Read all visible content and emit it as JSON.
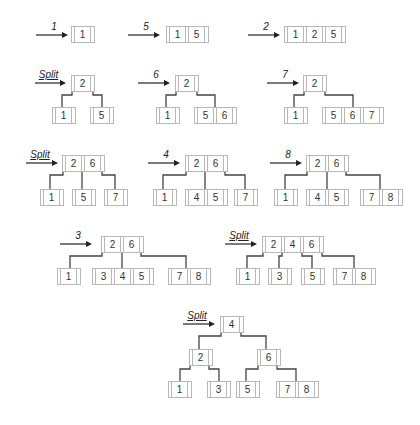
{
  "colors": {
    "edge": "#444444",
    "border": "#b8b8b8",
    "text": "#333333"
  },
  "steps": [
    {
      "label": "1",
      "arrow": [
        36,
        68,
        35
      ],
      "nodes": [
        {
          "keys": [
            "1"
          ],
          "x": 71,
          "y": 26
        }
      ],
      "edges": []
    },
    {
      "label": "5",
      "arrow": [
        128,
        160,
        35
      ],
      "nodes": [
        {
          "keys": [
            "1",
            "5"
          ],
          "x": 166,
          "y": 26
        }
      ],
      "edges": []
    },
    {
      "label": "2",
      "arrow": [
        248,
        280,
        35
      ],
      "nodes": [
        {
          "keys": [
            "1",
            "2",
            "5"
          ],
          "x": 284,
          "y": 26
        }
      ],
      "edges": []
    },
    {
      "label": "Split",
      "arrow": [
        35,
        66,
        83
      ],
      "nodes": [
        {
          "keys": [
            "2"
          ],
          "x": 71,
          "y": 75
        },
        {
          "keys": [
            "1"
          ],
          "x": 52,
          "y": 107
        },
        {
          "keys": [
            "5"
          ],
          "x": 90,
          "y": 107
        }
      ],
      "edges": [
        [
          72,
          89,
          62,
          107
        ],
        [
          93,
          89,
          102,
          107
        ]
      ]
    },
    {
      "label": "6",
      "arrow": [
        138,
        170,
        83
      ],
      "nodes": [
        {
          "keys": [
            "2"
          ],
          "x": 175,
          "y": 75
        },
        {
          "keys": [
            "1"
          ],
          "x": 156,
          "y": 107
        },
        {
          "keys": [
            "5",
            "6"
          ],
          "x": 194,
          "y": 107
        }
      ],
      "edges": [
        [
          176,
          89,
          166,
          107
        ],
        [
          197,
          89,
          215,
          107
        ]
      ]
    },
    {
      "label": "7",
      "arrow": [
        267,
        299,
        83
      ],
      "nodes": [
        {
          "keys": [
            "2"
          ],
          "x": 303,
          "y": 75
        },
        {
          "keys": [
            "1"
          ],
          "x": 284,
          "y": 107
        },
        {
          "keys": [
            "5",
            "6",
            "7"
          ],
          "x": 322,
          "y": 107
        }
      ],
      "edges": [
        [
          304,
          89,
          294,
          107
        ],
        [
          325,
          89,
          353,
          107
        ]
      ]
    },
    {
      "label": "Split",
      "arrow": [
        26,
        58,
        163
      ],
      "nodes": [
        {
          "keys": [
            "2",
            "6"
          ],
          "x": 62,
          "y": 155
        },
        {
          "keys": [
            "1"
          ],
          "x": 40,
          "y": 189
        },
        {
          "keys": [
            "5"
          ],
          "x": 72,
          "y": 189
        },
        {
          "keys": [
            "7"
          ],
          "x": 104,
          "y": 189
        }
      ],
      "edges": [
        [
          63,
          169,
          50,
          189
        ],
        [
          82,
          169,
          82,
          189
        ],
        [
          102,
          169,
          115,
          189
        ]
      ]
    },
    {
      "label": "4",
      "arrow": [
        148,
        180,
        163
      ],
      "nodes": [
        {
          "keys": [
            "2",
            "6"
          ],
          "x": 185,
          "y": 155
        },
        {
          "keys": [
            "1"
          ],
          "x": 153,
          "y": 189
        },
        {
          "keys": [
            "4",
            "5"
          ],
          "x": 185,
          "y": 189
        },
        {
          "keys": [
            "7"
          ],
          "x": 234,
          "y": 189
        }
      ],
      "edges": [
        [
          186,
          169,
          163,
          189
        ],
        [
          205,
          169,
          205,
          189
        ],
        [
          225,
          169,
          245,
          189
        ]
      ]
    },
    {
      "label": "8",
      "arrow": [
        270,
        302,
        163
      ],
      "nodes": [
        {
          "keys": [
            "2",
            "6"
          ],
          "x": 306,
          "y": 155
        },
        {
          "keys": [
            "1"
          ],
          "x": 274,
          "y": 189
        },
        {
          "keys": [
            "4",
            "5"
          ],
          "x": 306,
          "y": 189
        },
        {
          "keys": [
            "7",
            "8"
          ],
          "x": 360,
          "y": 189
        }
      ],
      "edges": [
        [
          307,
          169,
          285,
          189
        ],
        [
          327,
          169,
          327,
          189
        ],
        [
          346,
          169,
          380,
          189
        ]
      ]
    },
    {
      "label": "3",
      "arrow": [
        60,
        92,
        244
      ],
      "nodes": [
        {
          "keys": [
            "2",
            "6"
          ],
          "x": 101,
          "y": 236
        },
        {
          "keys": [
            "1"
          ],
          "x": 57,
          "y": 268
        },
        {
          "keys": [
            "3",
            "4",
            "5"
          ],
          "x": 92,
          "y": 268
        },
        {
          "keys": [
            "7",
            "8"
          ],
          "x": 168,
          "y": 268
        }
      ],
      "edges": [
        [
          102,
          250,
          70,
          268
        ],
        [
          122,
          250,
          122,
          268
        ],
        [
          141,
          250,
          186,
          268
        ]
      ]
    },
    {
      "label": "Split",
      "arrow": [
        225,
        257,
        244
      ],
      "nodes": [
        {
          "keys": [
            "2",
            "4",
            "6"
          ],
          "x": 262,
          "y": 236
        },
        {
          "keys": [
            "1"
          ],
          "x": 236,
          "y": 268
        },
        {
          "keys": [
            "3"
          ],
          "x": 268,
          "y": 268
        },
        {
          "keys": [
            "5"
          ],
          "x": 301,
          "y": 268
        },
        {
          "keys": [
            "7",
            "8"
          ],
          "x": 333,
          "y": 268
        }
      ],
      "edges": [
        [
          263,
          250,
          247,
          268
        ],
        [
          282,
          250,
          279,
          268
        ],
        [
          302,
          250,
          312,
          268
        ],
        [
          322,
          250,
          354,
          268
        ]
      ]
    },
    {
      "label": "Split",
      "arrow": [
        183,
        215,
        324
      ],
      "nodes": [
        {
          "keys": [
            "4"
          ],
          "x": 220,
          "y": 316
        },
        {
          "keys": [
            "2"
          ],
          "x": 189,
          "y": 349
        },
        {
          "keys": [
            "6"
          ],
          "x": 257,
          "y": 349
        },
        {
          "keys": [
            "1"
          ],
          "x": 168,
          "y": 381
        },
        {
          "keys": [
            "3"
          ],
          "x": 207,
          "y": 381
        },
        {
          "keys": [
            "5"
          ],
          "x": 236,
          "y": 381
        },
        {
          "keys": [
            "7",
            "8"
          ],
          "x": 276,
          "y": 381
        }
      ],
      "edges": [
        [
          221,
          330,
          199,
          349
        ],
        [
          241,
          330,
          266,
          349
        ],
        [
          190,
          363,
          180,
          381
        ],
        [
          209,
          363,
          219,
          381
        ],
        [
          258,
          363,
          246,
          381
        ],
        [
          277,
          363,
          296,
          381
        ]
      ]
    }
  ]
}
